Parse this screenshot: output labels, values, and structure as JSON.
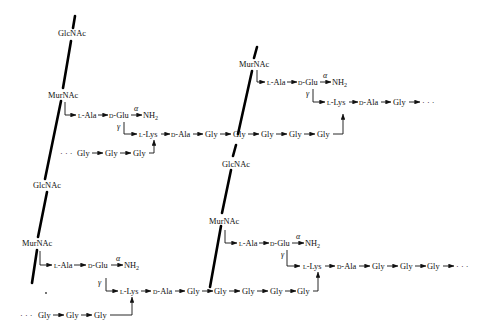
{
  "diagram": {
    "colors": {
      "line": "#000000",
      "text": "#111111",
      "background": "#ffffff"
    },
    "sugars": {
      "glcnac": "GlcNAc",
      "murnac": "MurNAc"
    },
    "residues": {
      "l_ala": "L-Ala",
      "d_glu": "D-Glu",
      "nh2": "NH2",
      "l_lys": "L-Lys",
      "d_ala": "D-Ala",
      "gly": "Gly",
      "ellipsis": "· · ·",
      "alpha": "α",
      "gamma": "γ"
    },
    "strands": [
      {
        "name": "left-glycan-strand",
        "units": [
          {
            "sugar": "GlcNAc",
            "pos": [
              61,
              36
            ]
          },
          {
            "sugar": "MurNAc",
            "pos": [
              49,
              96
            ],
            "stem": [
              "L-Ala",
              "D-Glu",
              "NH2",
              "L-Lys",
              "D-Ala",
              "Gly",
              "Gly",
              "Gly",
              "Gly",
              "Gly",
              "Gly"
            ]
          },
          {
            "sugar": "GlcNAc",
            "pos": [
              40,
              187
            ]
          },
          {
            "sugar": "MurNAc",
            "pos": [
              26,
              245
            ],
            "stem": [
              "L-Ala",
              "D-Glu",
              "NH2",
              "L-Lys",
              "D-Ala",
              "Gly",
              "Gly",
              "Gly",
              "Gly",
              "Gly",
              "Gly"
            ]
          }
        ]
      },
      {
        "name": "right-glycan-strand",
        "units": [
          {
            "sugar": "MurNAc",
            "pos": [
              248,
              65
            ],
            "stem": [
              "L-Ala",
              "D-Glu",
              "NH2",
              "L-Lys",
              "D-Ala",
              "Gly",
              "· · ·"
            ]
          },
          {
            "sugar": "GlcNAc",
            "pos": [
              231,
              164
            ]
          },
          {
            "sugar": "MurNAc",
            "pos": [
              222,
              221
            ],
            "stem": [
              "L-Ala",
              "D-Glu",
              "NH2",
              "L-Lys",
              "D-Ala",
              "Gly",
              "Gly",
              "Gly",
              "· · ·"
            ]
          }
        ]
      }
    ],
    "crossbridges": [
      {
        "from": "left-upper-D-Ala",
        "chain": [
          "Gly",
          "Gly",
          "Gly",
          "Gly",
          "Gly"
        ],
        "to": "right-upper-L-Lys"
      },
      {
        "from": "left-lower-D-Ala",
        "chain": [
          "Gly",
          "Gly",
          "Gly",
          "Gly",
          "Gly"
        ],
        "to": "right-lower-L-Lys"
      },
      {
        "from": "· · ·",
        "chain": [
          "Gly",
          "Gly",
          "Gly"
        ],
        "to": "left-upper-L-Lys"
      },
      {
        "from": "· · ·",
        "chain": [
          "Gly",
          "Gly",
          "Gly"
        ],
        "to": "left-lower-L-Lys"
      }
    ]
  }
}
